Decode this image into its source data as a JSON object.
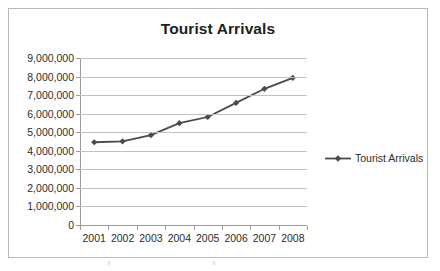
{
  "chart_data": {
    "type": "line",
    "title": "Tourist Arrivals",
    "xlabel": "",
    "ylabel": "",
    "categories": [
      "2001",
      "2002",
      "2003",
      "2004",
      "2005",
      "2006",
      "2007",
      "2008"
    ],
    "series": [
      {
        "name": "Tourist Arrivals",
        "values": [
          4460000,
          4510000,
          4840000,
          5490000,
          5820000,
          6580000,
          7340000,
          7930000
        ],
        "color": "#4a4a4a",
        "marker": "diamond"
      }
    ],
    "ylim": [
      0,
      9000000
    ],
    "ytick_values": [
      0,
      1000000,
      2000000,
      3000000,
      4000000,
      5000000,
      6000000,
      7000000,
      8000000,
      9000000
    ],
    "ytick_labels": [
      "0",
      "1,000,000",
      "2,000,000",
      "3,000,000",
      "4,000,000",
      "5,000,000",
      "6,000,000",
      "7,000,000",
      "8,000,000",
      "9,000,000"
    ],
    "grid": true,
    "grid_axis": "y",
    "legend": true,
    "legend_position": "right",
    "legend_entries": [
      "Tourist Arrivals"
    ]
  },
  "legend": {
    "label": "Tourist Arrivals"
  },
  "colors": {
    "series": "#4a4a4a",
    "gridline": "#c2c2c2",
    "axis": "#9a9a9a",
    "text": "#2b2b2b",
    "title": "#1d1d1d",
    "frame": "#b9b9b9",
    "background": "#ffffff"
  }
}
